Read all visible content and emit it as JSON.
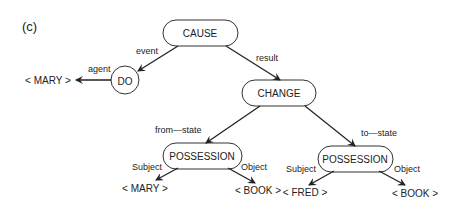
{
  "panel_label": "(c)",
  "nodes": {
    "cause": "CAUSE",
    "do": "DO",
    "change": "CHANGE",
    "possession_left": "POSSESSION",
    "possession_right": "POSSESSION"
  },
  "leaves": {
    "mary_agent": "< MARY >",
    "mary_subject": "< MARY >",
    "book_left": "< BOOK >",
    "fred_subject": "< FRED >",
    "book_right": "< BOOK >"
  },
  "edges": {
    "event": "event",
    "result": "result",
    "agent": "agent",
    "from_state": "from—state",
    "to_state": "to—state",
    "subject_left": "Subject",
    "object_left": "Object",
    "subject_right": "Subject",
    "object_right": "Object"
  }
}
